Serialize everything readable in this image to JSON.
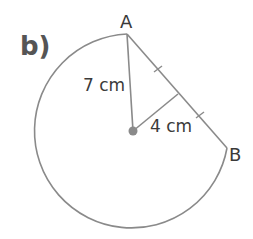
{
  "part_label": "b)",
  "points": {
    "A": {
      "label": "A"
    },
    "B": {
      "label": "B"
    },
    "center": {
      "label": ""
    }
  },
  "measurements": {
    "radius": "7 cm",
    "perpendicular": "4 cm"
  },
  "colors": {
    "stroke": "#8a8a8a",
    "center_dot": "#8a8a8a",
    "text": "#3a3a3a"
  }
}
